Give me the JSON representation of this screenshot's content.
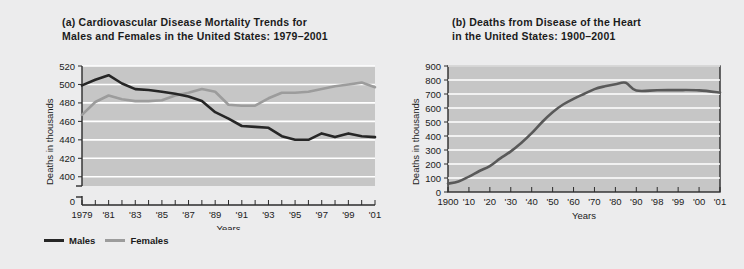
{
  "figure": {
    "background": "#ececed",
    "plot_background": "#c6c6c6",
    "gridline_color": "#ffffff",
    "axis_color": "#2b2b2b"
  },
  "legend": {
    "position": "below-left-panel",
    "entries": [
      {
        "label": "Males",
        "color": "#262626"
      },
      {
        "label": "Females",
        "color": "#9c9c9c"
      }
    ]
  },
  "chart_data": [
    {
      "type": "line",
      "panel": "a",
      "title": "(a) Cardiovascular Disease Mortality Trends for\nMales and Females in the United States: 1979–2001",
      "xlabel": "Years",
      "ylabel": "Deaths in thousands",
      "grid": true,
      "legend": "bottom-left",
      "axis_break": true,
      "ylim": [
        390,
        520
      ],
      "yticks": [
        0,
        400,
        420,
        440,
        460,
        480,
        500,
        520
      ],
      "ytick_labels": [
        "0",
        "400",
        "420",
        "440",
        "460",
        "480",
        "500",
        "520"
      ],
      "x": [
        1979,
        1980,
        1981,
        1982,
        1983,
        1984,
        1985,
        1986,
        1987,
        1988,
        1989,
        1990,
        1991,
        1992,
        1993,
        1994,
        1995,
        1996,
        1997,
        1998,
        1999,
        2000,
        2001
      ],
      "xtick_labels": [
        "1979",
        "'81",
        "'83",
        "'85",
        "'87",
        "'89",
        "'91",
        "'93",
        "'95",
        "'97",
        "'99",
        "'01"
      ],
      "series": [
        {
          "name": "Males",
          "color": "#262626",
          "values": [
            499,
            505,
            510,
            501,
            495,
            494,
            492,
            490,
            487,
            482,
            470,
            463,
            455,
            454,
            453,
            444,
            440,
            440,
            447,
            443,
            447,
            444,
            443
          ]
        },
        {
          "name": "Females",
          "color": "#9c9c9c",
          "values": [
            467,
            481,
            488,
            484,
            482,
            482,
            483,
            488,
            491,
            495,
            492,
            478,
            477,
            477,
            485,
            491,
            491,
            492,
            495,
            498,
            500,
            502,
            497
          ]
        }
      ]
    },
    {
      "type": "line",
      "panel": "b",
      "title": "(b) Deaths from Disease of the Heart\nin the United States: 1900–2001",
      "xlabel": "Years",
      "ylabel": "Deaths in thousands",
      "grid": true,
      "ylim": [
        0,
        900
      ],
      "yticks": [
        0,
        100,
        200,
        300,
        400,
        500,
        600,
        700,
        800,
        900
      ],
      "ytick_labels": [
        "0",
        "100",
        "200",
        "300",
        "400",
        "500",
        "600",
        "700",
        "800",
        "900"
      ],
      "xtick_labels": [
        "1900",
        "'10",
        "'20",
        "'30",
        "'40",
        "'50",
        "'60",
        "'70",
        "'80",
        "'90",
        "'98",
        "'99",
        "'00",
        "'01"
      ],
      "series": [
        {
          "name": "Deaths from Disease of the Heart",
          "color": "#595959",
          "points": [
            {
              "x": "1900",
              "y": 60
            },
            {
              "x": "1905",
              "y": 75
            },
            {
              "x": "1910",
              "y": 110
            },
            {
              "x": "1915",
              "y": 150
            },
            {
              "x": "1920",
              "y": 185
            },
            {
              "x": "1925",
              "y": 240
            },
            {
              "x": "1930",
              "y": 290
            },
            {
              "x": "1935",
              "y": 350
            },
            {
              "x": "1940",
              "y": 420
            },
            {
              "x": "1945",
              "y": 500
            },
            {
              "x": "1950",
              "y": 570
            },
            {
              "x": "1955",
              "y": 625
            },
            {
              "x": "1960",
              "y": 665
            },
            {
              "x": "1965",
              "y": 700
            },
            {
              "x": "1970",
              "y": 735
            },
            {
              "x": "1975",
              "y": 755
            },
            {
              "x": "1980",
              "y": 770
            },
            {
              "x": "1985",
              "y": 780
            },
            {
              "x": "1990",
              "y": 725
            },
            {
              "x": "1998",
              "y": 727
            },
            {
              "x": "1999",
              "y": 728
            },
            {
              "x": "2000",
              "y": 726
            },
            {
              "x": "2001",
              "y": 710
            }
          ]
        }
      ]
    }
  ]
}
